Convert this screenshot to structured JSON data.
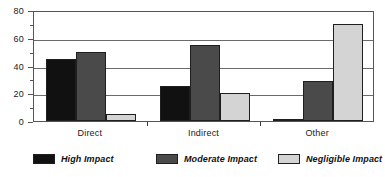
{
  "chart_data": {
    "type": "bar",
    "title": "",
    "xlabel": "",
    "ylabel": "",
    "categories": [
      "Direct",
      "Indirect",
      "Other"
    ],
    "series": [
      {
        "name": "High Impact",
        "color": "#111111",
        "values": [
          45,
          25,
          1
        ]
      },
      {
        "name": "Moderate Impact",
        "color": "#4a4a4a",
        "values": [
          50,
          55,
          29
        ]
      },
      {
        "name": "Negligible Impact",
        "color": "#d4d4d4",
        "values": [
          5,
          20,
          70
        ]
      }
    ],
    "ylim": [
      0,
      80
    ],
    "y_ticks": [
      0,
      20,
      40,
      60,
      80
    ],
    "y_minor_ticks": [
      10,
      30,
      50,
      70
    ],
    "grid": true,
    "grid_axis": "y",
    "legend_position": "bottom"
  },
  "axis": {
    "y_tick_labels": [
      "0",
      "20",
      "40",
      "60",
      "80"
    ]
  },
  "legend": {
    "entries": [
      {
        "label": "High Impact"
      },
      {
        "label": "Moderate Impact"
      },
      {
        "label": "Negligible Impact"
      }
    ]
  }
}
